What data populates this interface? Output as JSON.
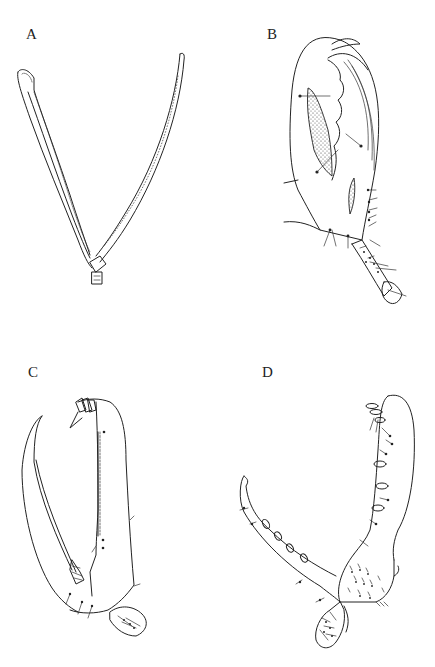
{
  "figure": {
    "panels": [
      {
        "id": "A",
        "label": "A",
        "description": "elongated V-shaped appendage with dense setal row on left arm and fine setae along right arm"
      },
      {
        "id": "B",
        "label": "B",
        "description": "oval chela/propodus with stippled regions, curved dactyl and setose carpus"
      },
      {
        "id": "C",
        "label": "C",
        "description": "rectangular propodus with row of serrate spines and curved dactyl"
      },
      {
        "id": "D",
        "label": "D",
        "description": "propodus with robust spines, long curved dactyl with spines and setose carpus"
      }
    ]
  }
}
